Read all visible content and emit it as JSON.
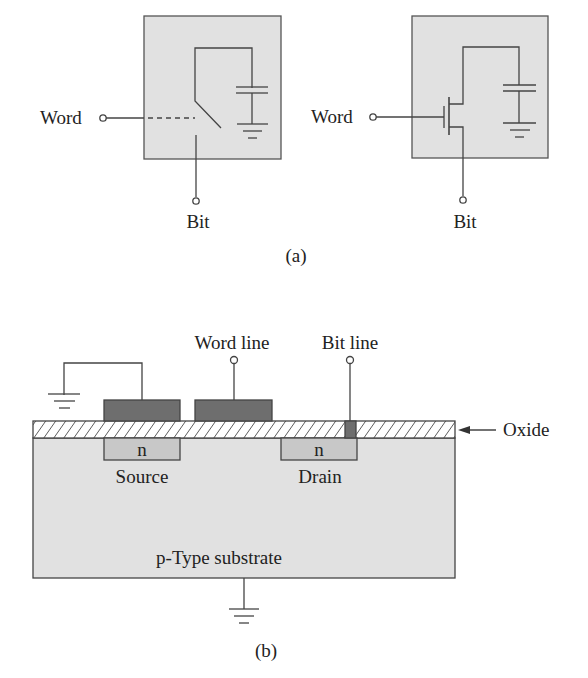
{
  "figure": {
    "part_a": {
      "caption": "(a)",
      "switch_cell": {
        "word_label": "Word",
        "bit_label": "Bit"
      },
      "transistor_cell": {
        "word_label": "Word",
        "bit_label": "Bit"
      }
    },
    "part_b": {
      "caption": "(b)",
      "word_line_label": "Word line",
      "bit_line_label": "Bit line",
      "oxide_label": "Oxide",
      "source_region_label": "n",
      "drain_region_label": "n",
      "source_label": "Source",
      "drain_label": "Drain",
      "substrate_label": "p-Type substrate"
    },
    "colors": {
      "box_fill": "#e1e1e1",
      "gate_fill": "#6e6e6e",
      "n_region_fill": "#c8c8c8",
      "line": "#333333"
    }
  }
}
